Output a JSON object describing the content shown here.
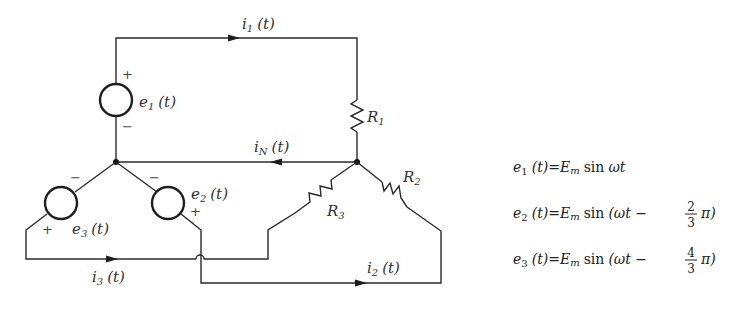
{
  "labels": {
    "i1": "i",
    "i1_sub": "1",
    "i1_arg": "(t)",
    "iN": "i",
    "iN_sub": "N",
    "iN_arg": "(t)",
    "i2": "i",
    "i2_sub": "2",
    "i2_arg": "(t)",
    "i3": "i",
    "i3_sub": "3",
    "i3_arg": "(t)",
    "e1": "e",
    "e1_sub": "1",
    "e1_arg": "(t)",
    "e2": "e",
    "e2_sub": "2",
    "e2_arg": "(t)",
    "e3": "e",
    "e3_sub": "3",
    "e3_arg": "(t)",
    "R1": "R",
    "R1_sub": "1",
    "R2": "R",
    "R2_sub": "2",
    "R3": "R",
    "R3_sub": "3",
    "plus": "+",
    "minus": "−"
  },
  "equations": [
    {
      "lhs": "e",
      "sub": "1",
      "arg": "(t)",
      "eq": "=",
      "amp": "E",
      "amp_sub": "m",
      "fn": "sin",
      "body": "ωt",
      "frac_num": "",
      "frac_den": "",
      "tail": ""
    },
    {
      "lhs": "e",
      "sub": "2",
      "arg": "(t)",
      "eq": "=",
      "amp": "E",
      "amp_sub": "m",
      "fn": "sin",
      "body": "(ωt −",
      "frac_num": "2",
      "frac_den": "3",
      "tail": "π)"
    },
    {
      "lhs": "e",
      "sub": "3",
      "arg": "(t)",
      "eq": "=",
      "amp": "E",
      "amp_sub": "m",
      "fn": "sin",
      "body": "(ωt −",
      "frac_num": "4",
      "frac_den": "3",
      "tail": "π)"
    }
  ]
}
